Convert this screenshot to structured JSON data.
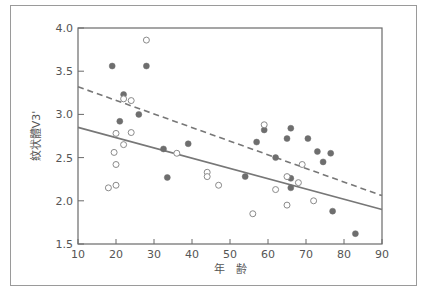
{
  "chart_data": {
    "type": "scatter",
    "title": "",
    "xlabel": "年　齢",
    "ylabel": "紋状體V3'",
    "xlim": [
      10,
      90
    ],
    "ylim": [
      1.5,
      4.0
    ],
    "x_ticks": [
      "10",
      "20",
      "30",
      "40",
      "50",
      "60",
      "70",
      "80",
      "90"
    ],
    "y_ticks": [
      "1.5",
      "2.0",
      "2.5",
      "3.0",
      "3.5",
      "4.0"
    ],
    "grid": false,
    "legend": null,
    "series": [
      {
        "name": "filled",
        "marker": "filled-circle",
        "color": "#6e6e6e",
        "points": [
          [
            19,
            3.56
          ],
          [
            28,
            3.56
          ],
          [
            22,
            3.23
          ],
          [
            26,
            3.0
          ],
          [
            21,
            2.92
          ],
          [
            32.5,
            2.6
          ],
          [
            39,
            2.66
          ],
          [
            33.5,
            2.27
          ],
          [
            54,
            2.28
          ],
          [
            59,
            2.82
          ],
          [
            66,
            2.84
          ],
          [
            57,
            2.68
          ],
          [
            65,
            2.72
          ],
          [
            70.5,
            2.72
          ],
          [
            73,
            2.57
          ],
          [
            76.5,
            2.55
          ],
          [
            74.5,
            2.45
          ],
          [
            62,
            2.5
          ],
          [
            66,
            2.26
          ],
          [
            66,
            2.15
          ],
          [
            77,
            1.88
          ],
          [
            83,
            1.62
          ]
        ]
      },
      {
        "name": "open",
        "marker": "open-circle",
        "color": "#8a8a8a",
        "points": [
          [
            28,
            3.86
          ],
          [
            22,
            3.18
          ],
          [
            24,
            3.16
          ],
          [
            20,
            2.78
          ],
          [
            24,
            2.79
          ],
          [
            22,
            2.65
          ],
          [
            36,
            2.55
          ],
          [
            19.5,
            2.56
          ],
          [
            20,
            2.42
          ],
          [
            18,
            2.15
          ],
          [
            20,
            2.18
          ],
          [
            44,
            2.33
          ],
          [
            44,
            2.28
          ],
          [
            47,
            2.18
          ],
          [
            59,
            2.88
          ],
          [
            69,
            2.42
          ],
          [
            65,
            2.28
          ],
          [
            68,
            2.21
          ],
          [
            62,
            2.13
          ],
          [
            56,
            1.85
          ],
          [
            65,
            1.95
          ],
          [
            72,
            2.0
          ]
        ]
      }
    ],
    "lines": [
      {
        "name": "regression-filled",
        "style": "dashed",
        "color": "#777777",
        "x": [
          10,
          90
        ],
        "y": [
          3.32,
          2.06
        ]
      },
      {
        "name": "regression-open",
        "style": "solid",
        "color": "#777777",
        "x": [
          10,
          90
        ],
        "y": [
          2.85,
          1.9
        ]
      }
    ]
  }
}
